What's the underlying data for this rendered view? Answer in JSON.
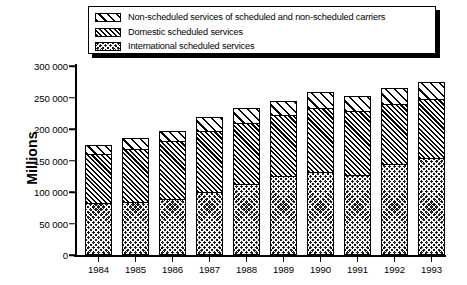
{
  "legend": {
    "position": "top",
    "entries": [
      {
        "swatch": "sparse-diagonal-hatch-pattern",
        "label": "Non-scheduled services of scheduled and non-scheduled carriers"
      },
      {
        "swatch": "dense-diagonal-hatch-pattern",
        "label": "Domestic scheduled services"
      },
      {
        "swatch": "dark-cross-hatch-pattern",
        "label": "International scheduled services"
      }
    ]
  },
  "chart_data": {
    "type": "bar",
    "subtype": "stacked-vertical",
    "title": "",
    "xlabel": "",
    "ylabel": "Millions",
    "categories": [
      "1984",
      "1985",
      "1986",
      "1987",
      "1988",
      "1989",
      "1990",
      "1991",
      "1992",
      "1993"
    ],
    "series": [
      {
        "name": "International scheduled services",
        "pattern": "dark-cross-hatch-pattern",
        "values": [
          82000,
          84000,
          89000,
          100000,
          113000,
          125000,
          131000,
          127000,
          145000,
          154000
        ]
      },
      {
        "name": "Domestic scheduled services",
        "pattern": "dense-diagonal-hatch-pattern",
        "values": [
          79000,
          84000,
          92000,
          97000,
          96000,
          97000,
          102000,
          102000,
          94000,
          93000
        ]
      },
      {
        "name": "Non-scheduled services of scheduled and non-scheduled carriers",
        "pattern": "sparse-diagonal-hatch-pattern",
        "values": [
          14000,
          17000,
          16000,
          22000,
          25000,
          23000,
          26000,
          24000,
          26000,
          28000
        ]
      }
    ],
    "totals": [
      175000,
      185000,
      197000,
      219000,
      234000,
      245000,
      259000,
      253000,
      265000,
      275000
    ],
    "ylim": [
      0,
      300000
    ],
    "ytick_values": [
      0,
      50000,
      100000,
      150000,
      200000,
      250000,
      300000
    ],
    "ytick_labels": [
      "0",
      "50 000",
      "100 000",
      "150 000",
      "200 000",
      "250 000",
      "300 000"
    ],
    "grid": false,
    "legend_position": "top"
  }
}
